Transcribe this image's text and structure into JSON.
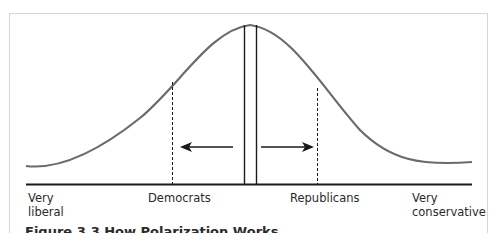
{
  "diagram": {
    "type": "distribution-curve",
    "labels": {
      "far_left_line1": "Very",
      "far_left_line2": "liberal",
      "left_party": "Democrats",
      "right_party": "Republicans",
      "far_right_line1": "Very",
      "far_right_line2": "conservative"
    },
    "arrows": [
      {
        "direction": "left",
        "meaning": "Democrats move left"
      },
      {
        "direction": "right",
        "meaning": "Republicans move right"
      }
    ],
    "colors": {
      "curve": "#6b6b6b",
      "lines": "#1a1a1a",
      "frame": "#d6d6d6"
    }
  },
  "caption": "Figure 3.3 How Polarization Works"
}
